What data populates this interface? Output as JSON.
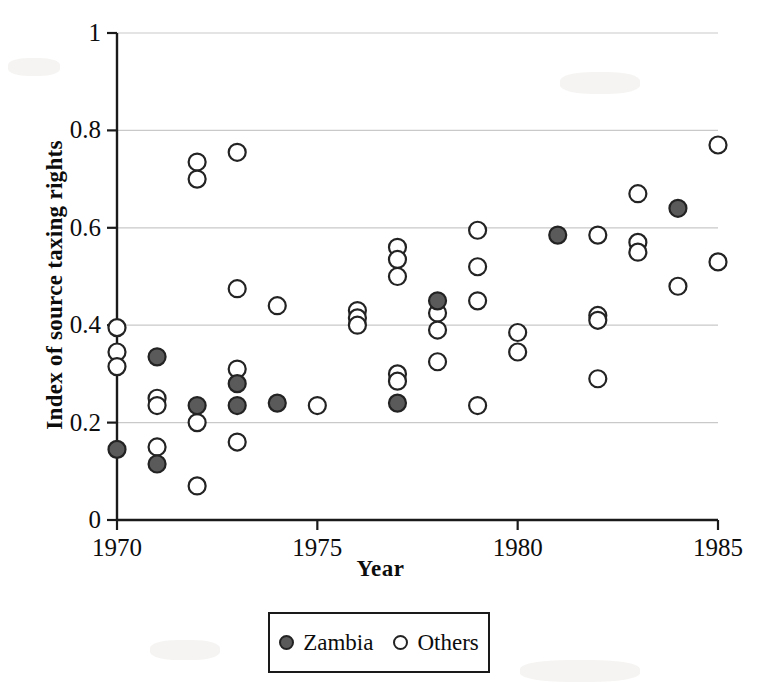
{
  "chart_data": {
    "type": "scatter",
    "title": "",
    "xlabel": "Year",
    "ylabel": "Index of source taxing rights",
    "xlim": [
      1970,
      1985
    ],
    "ylim": [
      0,
      1
    ],
    "xticks": [
      1970,
      1975,
      1980,
      1985
    ],
    "xtick_labels": [
      "1970",
      "1975",
      "1980",
      "1985"
    ],
    "yticks": [
      0,
      0.2,
      0.4,
      0.6,
      0.8,
      1
    ],
    "ytick_labels": [
      "0",
      "0.2",
      "0.4",
      "0.6",
      "0.8",
      "1"
    ],
    "grid": "horizontal",
    "legend_position": "below-center",
    "series": [
      {
        "name": "Zambia",
        "marker": "filled-circle",
        "color": "#5a5a5a",
        "edge_color": "#232323",
        "points": [
          {
            "x": 1970,
            "y": 0.145
          },
          {
            "x": 1971,
            "y": 0.335
          },
          {
            "x": 1971,
            "y": 0.115
          },
          {
            "x": 1972,
            "y": 0.235
          },
          {
            "x": 1973,
            "y": 0.28
          },
          {
            "x": 1973,
            "y": 0.235
          },
          {
            "x": 1974,
            "y": 0.24
          },
          {
            "x": 1977,
            "y": 0.24
          },
          {
            "x": 1978,
            "y": 0.45
          },
          {
            "x": 1981,
            "y": 0.585
          },
          {
            "x": 1984,
            "y": 0.64
          }
        ]
      },
      {
        "name": "Others",
        "marker": "open-circle",
        "color": "#ffffff",
        "edge_color": "#232323",
        "points": [
          {
            "x": 1970,
            "y": 0.395
          },
          {
            "x": 1970,
            "y": 0.345
          },
          {
            "x": 1970,
            "y": 0.315
          },
          {
            "x": 1971,
            "y": 0.25
          },
          {
            "x": 1971,
            "y": 0.235
          },
          {
            "x": 1971,
            "y": 0.15
          },
          {
            "x": 1972,
            "y": 0.735
          },
          {
            "x": 1972,
            "y": 0.7
          },
          {
            "x": 1972,
            "y": 0.2
          },
          {
            "x": 1972,
            "y": 0.07
          },
          {
            "x": 1973,
            "y": 0.755
          },
          {
            "x": 1973,
            "y": 0.475
          },
          {
            "x": 1973,
            "y": 0.31
          },
          {
            "x": 1973,
            "y": 0.16
          },
          {
            "x": 1974,
            "y": 0.44
          },
          {
            "x": 1975,
            "y": 0.235
          },
          {
            "x": 1976,
            "y": 0.43
          },
          {
            "x": 1976,
            "y": 0.415
          },
          {
            "x": 1976,
            "y": 0.4
          },
          {
            "x": 1977,
            "y": 0.56
          },
          {
            "x": 1977,
            "y": 0.535
          },
          {
            "x": 1977,
            "y": 0.5
          },
          {
            "x": 1977,
            "y": 0.3
          },
          {
            "x": 1977,
            "y": 0.285
          },
          {
            "x": 1978,
            "y": 0.425
          },
          {
            "x": 1978,
            "y": 0.39
          },
          {
            "x": 1978,
            "y": 0.325
          },
          {
            "x": 1979,
            "y": 0.595
          },
          {
            "x": 1979,
            "y": 0.52
          },
          {
            "x": 1979,
            "y": 0.45
          },
          {
            "x": 1979,
            "y": 0.235
          },
          {
            "x": 1980,
            "y": 0.385
          },
          {
            "x": 1980,
            "y": 0.345
          },
          {
            "x": 1982,
            "y": 0.585
          },
          {
            "x": 1982,
            "y": 0.42
          },
          {
            "x": 1982,
            "y": 0.41
          },
          {
            "x": 1982,
            "y": 0.29
          },
          {
            "x": 1983,
            "y": 0.67
          },
          {
            "x": 1983,
            "y": 0.57
          },
          {
            "x": 1983,
            "y": 0.55
          },
          {
            "x": 1984,
            "y": 0.48
          },
          {
            "x": 1985,
            "y": 0.77
          },
          {
            "x": 1985,
            "y": 0.53
          }
        ]
      }
    ]
  },
  "legend": {
    "entries": [
      {
        "label": "Zambia",
        "marker": "filled-circle"
      },
      {
        "label": "Others",
        "marker": "open-circle"
      }
    ]
  },
  "colors": {
    "zambia_fill": "#5a5a5a",
    "marker_edge": "#232323",
    "axis": "#1a1a1a",
    "gridline": "#c9c9c9",
    "background": "#ffffff"
  }
}
